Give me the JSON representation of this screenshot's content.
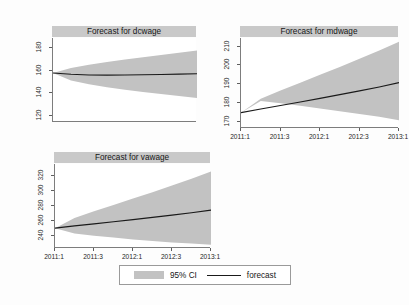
{
  "figure": {
    "background_color": "#fdfdfd",
    "band_color": "#c2c2c2",
    "line_color": "#1a1a1a",
    "title_bar_color": "#c9c9c9"
  },
  "legend": {
    "ci_label": "95% CI",
    "forecast_label": "forecast"
  },
  "chart_data": [
    {
      "type": "area",
      "title": "Forecast for dcwage",
      "xlabel": "",
      "ylabel": "",
      "grid": false,
      "x": [
        "2011:1",
        "2011:2",
        "2011:3",
        "2011:4",
        "2012:1",
        "2012:2",
        "2012:3",
        "2012:4",
        "2013:1"
      ],
      "xtick_labels": [
        "2011:1",
        "2011:3",
        "2012:1",
        "2012:3",
        "2013:1"
      ],
      "xtick_values": [
        "2011:1",
        "2011:3",
        "2012:1",
        "2012:3",
        "2013:1"
      ],
      "ytick_labels": [
        "120",
        "140",
        "160",
        "180"
      ],
      "ylim": [
        114,
        188
      ],
      "series": [
        {
          "name": "forecast",
          "values": [
            157.2,
            156.0,
            155.4,
            155.3,
            155.4,
            155.6,
            155.9,
            156.2,
            156.5
          ]
        },
        {
          "name": "ci_upper",
          "values": [
            157.2,
            161.5,
            164.4,
            166.8,
            169.0,
            171.0,
            173.0,
            175.0,
            177.0
          ]
        },
        {
          "name": "ci_lower",
          "values": [
            157.2,
            150.5,
            147.2,
            144.6,
            142.4,
            140.4,
            138.6,
            136.8,
            135.2
          ]
        }
      ]
    },
    {
      "type": "area",
      "title": "Forecast for mdwage",
      "xlabel": "",
      "ylabel": "",
      "grid": false,
      "x": [
        "2011:1",
        "2011:2",
        "2011:3",
        "2011:4",
        "2012:1",
        "2012:2",
        "2012:3",
        "2012:4",
        "2013:1"
      ],
      "xtick_labels": [
        "2011:1",
        "2011:3",
        "2012:1",
        "2012:3",
        "2013:1"
      ],
      "xtick_values": [
        "2011:1",
        "2011:3",
        "2012:1",
        "2012:3",
        "2013:1"
      ],
      "ytick_labels": [
        "170",
        "180",
        "190",
        "200",
        "210"
      ],
      "ylim": [
        166,
        214
      ],
      "series": [
        {
          "name": "forecast",
          "values": [
            174.2,
            176.1,
            178.0,
            179.9,
            181.8,
            183.8,
            185.8,
            187.9,
            190.2
          ]
        },
        {
          "name": "ci_upper",
          "values": [
            174.2,
            181.6,
            186.0,
            190.2,
            194.4,
            198.6,
            202.9,
            207.3,
            212.0
          ]
        },
        {
          "name": "ci_lower",
          "values": [
            174.2,
            180.4,
            179.2,
            177.8,
            176.4,
            175.0,
            173.5,
            172.0,
            170.2
          ]
        }
      ]
    },
    {
      "type": "area",
      "title": "Forecast for vawage",
      "xlabel": "",
      "ylabel": "",
      "grid": false,
      "x": [
        "2011:1",
        "2011:2",
        "2011:3",
        "2011:4",
        "2012:1",
        "2012:2",
        "2012:3",
        "2012:4",
        "2013:1"
      ],
      "xtick_labels": [
        "2011:1",
        "2011:3",
        "2012:1",
        "2012:3",
        "2013:1"
      ],
      "xtick_values": [
        "2011:1",
        "2011:3",
        "2012:1",
        "2012:3",
        "2013:1"
      ],
      "ytick_labels": [
        "240",
        "260",
        "280",
        "300",
        "320"
      ],
      "ylim": [
        222,
        334
      ],
      "series": [
        {
          "name": "forecast",
          "values": [
            248.5,
            251.5,
            254.2,
            257.0,
            259.8,
            262.8,
            265.8,
            269.0,
            272.5
          ]
        },
        {
          "name": "ci_upper",
          "values": [
            248.5,
            262.0,
            271.0,
            279.5,
            288.0,
            296.5,
            305.5,
            314.5,
            324.0
          ]
        },
        {
          "name": "ci_lower",
          "values": [
            248.5,
            241.5,
            238.5,
            236.0,
            233.5,
            231.5,
            229.5,
            228.0,
            226.5
          ]
        }
      ]
    }
  ]
}
